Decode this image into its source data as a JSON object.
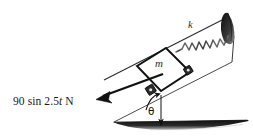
{
  "figure": {
    "background_color": "#ffffff",
    "ink_color": "#1a1a1a",
    "labels": {
      "applied_force_prefix": "90 sin 2.5",
      "applied_force_variable": "t",
      "applied_force_suffix": " N",
      "applied_force_full": "90 sin 2.5t N",
      "mass": "m",
      "spring_constant": "k",
      "angle": "θ"
    },
    "elements": {
      "incline_rail": "inclined-guide-rail",
      "block": "mass-block",
      "rollers": "corner-rollers",
      "spring": "coil-spring",
      "wall": "upper-wall-support",
      "ground": "ground-surface",
      "force_arrow": "applied-force-arrow",
      "angle_arc": "incline-angle-arc",
      "vertical_reference": "vertical-reference-line"
    },
    "geometry": {
      "incline_angle_degrees": 27,
      "ground_y": 122,
      "incline_base_x": 114,
      "block_center_x": 163,
      "block_center_y": 63
    }
  }
}
